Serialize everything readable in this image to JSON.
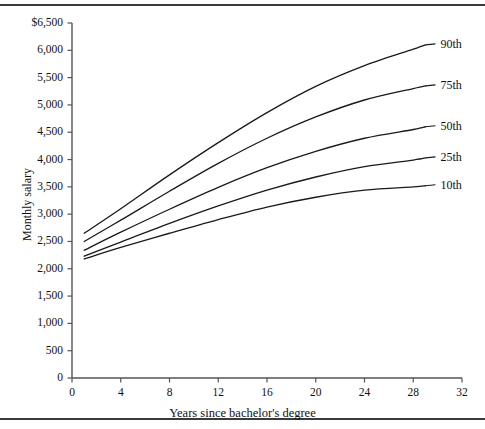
{
  "chart_data": {
    "type": "line",
    "title": "",
    "xlabel": "Years since bachelor's degree",
    "ylabel": "Monthly salary",
    "xlim": [
      0,
      32
    ],
    "ylim": [
      0,
      6500
    ],
    "xticks": [
      "0",
      "4",
      "8",
      "12",
      "16",
      "20",
      "24",
      "28",
      "32"
    ],
    "xtick_values": [
      0,
      4,
      8,
      12,
      16,
      20,
      24,
      28,
      32
    ],
    "yticks": [
      "0",
      "500",
      "1,000",
      "1,500",
      "2,000",
      "2,500",
      "3,000",
      "3,500",
      "4,000",
      "4,500",
      "5,000",
      "5,500",
      "6,000",
      "$6,500"
    ],
    "ytick_values": [
      0,
      500,
      1000,
      1500,
      2000,
      2500,
      3000,
      3500,
      4000,
      4500,
      5000,
      5500,
      6000,
      6500
    ],
    "grid": false,
    "legend": "right-inline-labels",
    "x": [
      1,
      4,
      8,
      12,
      16,
      20,
      24,
      28,
      29
    ],
    "series": [
      {
        "name": "90th",
        "label": "90th",
        "color": "#1a1a1a",
        "values": [
          2650,
          3100,
          3720,
          4310,
          4860,
          5340,
          5720,
          6020,
          6100
        ]
      },
      {
        "name": "75th",
        "label": "75th",
        "color": "#1a1a1a",
        "values": [
          2500,
          2890,
          3420,
          3930,
          4390,
          4780,
          5090,
          5300,
          5350
        ]
      },
      {
        "name": "50th",
        "label": "50th",
        "color": "#1a1a1a",
        "values": [
          2340,
          2670,
          3090,
          3490,
          3850,
          4150,
          4390,
          4550,
          4600
        ]
      },
      {
        "name": "25th",
        "label": "25th",
        "color": "#1a1a1a",
        "values": [
          2230,
          2490,
          2830,
          3150,
          3440,
          3680,
          3870,
          3990,
          4030
        ]
      },
      {
        "name": "10th",
        "label": "10th",
        "color": "#1a1a1a",
        "values": [
          2180,
          2390,
          2650,
          2900,
          3130,
          3310,
          3440,
          3500,
          3520
        ]
      }
    ]
  },
  "axis": {
    "y_title": "Monthly salary",
    "x_title": "Years since bachelor's degree"
  }
}
